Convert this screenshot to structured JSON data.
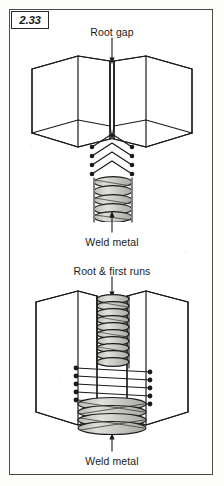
{
  "figure": {
    "number": "2.33",
    "kind": "welding-joint-illustration",
    "background_color": "#ffffff",
    "line_color": "#1b1b1b",
    "weld_fill_color": "#c9c9c4"
  },
  "upper_diagram": {
    "name": "root-gap-diagram",
    "top_label": "Root gap",
    "bottom_label": "Weld metal",
    "description": "Isometric view of two plates butted together with a root gap, chevron shaped weld runs above a stacked weld metal column"
  },
  "lower_diagram": {
    "name": "root-and-first-runs-diagram",
    "top_label": "Root & first runs",
    "bottom_label": "Weld metal",
    "description": "Isometric view of two plates with root and first runs filling the joint, horizontal run lines with end dots over a stacked weld metal column"
  },
  "labels": [
    {
      "id": "upper-top",
      "text": "Root gap"
    },
    {
      "id": "upper-bottom",
      "text": "Weld metal"
    },
    {
      "id": "lower-top",
      "text": "Root & first runs"
    },
    {
      "id": "lower-bottom",
      "text": "Weld metal"
    }
  ]
}
